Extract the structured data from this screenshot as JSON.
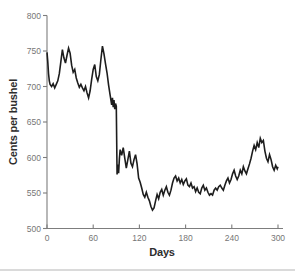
{
  "figure": {
    "background": "#ffffff",
    "bottom_rule_color": "#d4d4d4"
  },
  "chart_data": {
    "type": "line",
    "title": "",
    "xlabel": "Days",
    "ylabel": "Cents per bushel",
    "xlim": [
      0,
      300
    ],
    "ylim": [
      500,
      800
    ],
    "x_ticks": [
      0,
      60,
      120,
      180,
      240,
      300
    ],
    "y_ticks": [
      500,
      550,
      600,
      650,
      700,
      750,
      800
    ],
    "grid": false,
    "legend_position": "none",
    "line_color": "#1d1d1d",
    "axis_color": "#7d7d7d",
    "tick_label_color": "#767676",
    "axis_title_color": "#2d2d2d",
    "series": [
      {
        "name": "cents-per-bushel-price",
        "points": [
          [
            0,
            748
          ],
          [
            1,
            735
          ],
          [
            2,
            718
          ],
          [
            3,
            708
          ],
          [
            4,
            703
          ],
          [
            6,
            700
          ],
          [
            8,
            704
          ],
          [
            10,
            698
          ],
          [
            12,
            703
          ],
          [
            14,
            708
          ],
          [
            16,
            718
          ],
          [
            18,
            735
          ],
          [
            20,
            752
          ],
          [
            22,
            740
          ],
          [
            24,
            733
          ],
          [
            26,
            744
          ],
          [
            28,
            754
          ],
          [
            30,
            747
          ],
          [
            32,
            730
          ],
          [
            34,
            720
          ],
          [
            36,
            724
          ],
          [
            38,
            712
          ],
          [
            40,
            705
          ],
          [
            42,
            699
          ],
          [
            44,
            703
          ],
          [
            46,
            698
          ],
          [
            48,
            694
          ],
          [
            50,
            700
          ],
          [
            52,
            691
          ],
          [
            54,
            684
          ],
          [
            56,
            694
          ],
          [
            58,
            710
          ],
          [
            60,
            724
          ],
          [
            62,
            731
          ],
          [
            64,
            714
          ],
          [
            66,
            708
          ],
          [
            68,
            717
          ],
          [
            70,
            738
          ],
          [
            72,
            757
          ],
          [
            74,
            746
          ],
          [
            76,
            732
          ],
          [
            78,
            719
          ],
          [
            80,
            702
          ],
          [
            82,
            688
          ],
          [
            84,
            674
          ],
          [
            85,
            684
          ],
          [
            86,
            671
          ],
          [
            87,
            681
          ],
          [
            88,
            668
          ],
          [
            89,
            676
          ],
          [
            90,
            672
          ],
          [
            91,
            576
          ],
          [
            92,
            590
          ],
          [
            93,
            578
          ],
          [
            94,
            598
          ],
          [
            95,
            611
          ],
          [
            97,
            603
          ],
          [
            99,
            614
          ],
          [
            101,
            599
          ],
          [
            103,
            585
          ],
          [
            105,
            597
          ],
          [
            107,
            609
          ],
          [
            109,
            592
          ],
          [
            111,
            587
          ],
          [
            113,
            597
          ],
          [
            115,
            604
          ],
          [
            117,
            591
          ],
          [
            119,
            571
          ],
          [
            121,
            565
          ],
          [
            123,
            557
          ],
          [
            125,
            548
          ],
          [
            127,
            544
          ],
          [
            129,
            551
          ],
          [
            131,
            544
          ],
          [
            133,
            539
          ],
          [
            135,
            531
          ],
          [
            137,
            526
          ],
          [
            139,
            529
          ],
          [
            141,
            539
          ],
          [
            143,
            548
          ],
          [
            145,
            542
          ],
          [
            147,
            551
          ],
          [
            149,
            555
          ],
          [
            151,
            547
          ],
          [
            153,
            554
          ],
          [
            155,
            559
          ],
          [
            157,
            551
          ],
          [
            159,
            547
          ],
          [
            161,
            554
          ],
          [
            163,
            564
          ],
          [
            165,
            571
          ],
          [
            167,
            574
          ],
          [
            169,
            567
          ],
          [
            171,
            571
          ],
          [
            173,
            564
          ],
          [
            175,
            569
          ],
          [
            177,
            562
          ],
          [
            179,
            567
          ],
          [
            181,
            570
          ],
          [
            183,
            561
          ],
          [
            185,
            559
          ],
          [
            187,
            564
          ],
          [
            189,
            557
          ],
          [
            191,
            559
          ],
          [
            193,
            552
          ],
          [
            195,
            557
          ],
          [
            197,
            551
          ],
          [
            199,
            549
          ],
          [
            201,
            557
          ],
          [
            203,
            561
          ],
          [
            205,
            554
          ],
          [
            207,
            557
          ],
          [
            209,
            551
          ],
          [
            211,
            547
          ],
          [
            213,
            549
          ],
          [
            215,
            547
          ],
          [
            217,
            554
          ],
          [
            219,
            557
          ],
          [
            221,
            554
          ],
          [
            223,
            559
          ],
          [
            225,
            561
          ],
          [
            227,
            557
          ],
          [
            229,
            554
          ],
          [
            231,
            561
          ],
          [
            233,
            567
          ],
          [
            235,
            571
          ],
          [
            237,
            564
          ],
          [
            239,
            569
          ],
          [
            241,
            577
          ],
          [
            243,
            582
          ],
          [
            245,
            574
          ],
          [
            247,
            569
          ],
          [
            249,
            574
          ],
          [
            251,
            582
          ],
          [
            253,
            577
          ],
          [
            255,
            587
          ],
          [
            257,
            581
          ],
          [
            259,
            577
          ],
          [
            261,
            584
          ],
          [
            263,
            591
          ],
          [
            265,
            599
          ],
          [
            267,
            609
          ],
          [
            269,
            617
          ],
          [
            271,
            611
          ],
          [
            273,
            621
          ],
          [
            275,
            614
          ],
          [
            277,
            627
          ],
          [
            279,
            621
          ],
          [
            281,
            624
          ],
          [
            283,
            609
          ],
          [
            285,
            599
          ],
          [
            287,
            594
          ],
          [
            289,
            604
          ],
          [
            291,
            597
          ],
          [
            293,
            587
          ],
          [
            295,
            582
          ],
          [
            297,
            589
          ],
          [
            299,
            584
          ],
          [
            300,
            587
          ]
        ]
      }
    ]
  }
}
